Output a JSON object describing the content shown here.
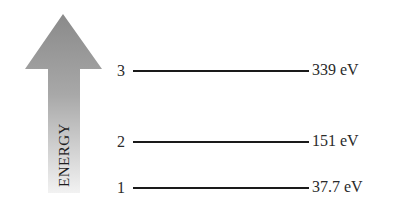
{
  "diagram": {
    "type": "energy-level-diagram",
    "axis_label": "ENERGY",
    "arrow": {
      "direction": "up",
      "color_top": "#8a8a8a",
      "color_bottom": "#f2f2f2"
    },
    "levels": [
      {
        "n": "3",
        "energy": "339 eV",
        "y": 71
      },
      {
        "n": "2",
        "energy": "151 eV",
        "y": 142
      },
      {
        "n": "1",
        "energy": "37.7 eV",
        "y": 188
      }
    ]
  }
}
